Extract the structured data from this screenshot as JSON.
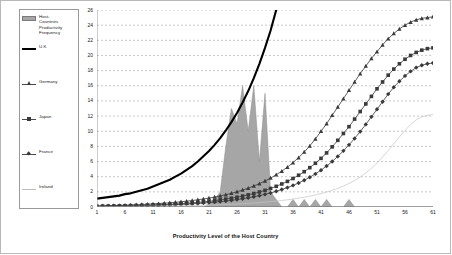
{
  "chart_data": {
    "type": "area",
    "title": "",
    "xlabel": "Productivity Level of the Host Country",
    "ylabel": "",
    "xlim": [
      1,
      61
    ],
    "ylim": [
      0,
      26
    ],
    "grid": true,
    "legend_position": "left-outside",
    "xticks": [
      1,
      6,
      11,
      16,
      21,
      26,
      31,
      36,
      41,
      46,
      51,
      56,
      61
    ],
    "yticks": [
      0,
      2,
      4,
      6,
      8,
      10,
      12,
      14,
      16,
      18,
      20,
      22,
      24,
      26
    ],
    "x": [
      1,
      2,
      3,
      4,
      5,
      6,
      7,
      8,
      9,
      10,
      11,
      12,
      13,
      14,
      15,
      16,
      17,
      18,
      19,
      20,
      21,
      22,
      23,
      24,
      25,
      26,
      27,
      28,
      29,
      30,
      31,
      32,
      33,
      34,
      35,
      36,
      37,
      38,
      39,
      40,
      41,
      42,
      43,
      44,
      45,
      46,
      47,
      48,
      49,
      50,
      51,
      52,
      53,
      54,
      55,
      56,
      57,
      58,
      59,
      60,
      61
    ],
    "series": [
      {
        "name": "Host-Countries Productivity Frequency",
        "label": "Host-\nCountries\nProductivity\nFrequency",
        "type": "area",
        "color": "#a6a6a6",
        "values": [
          0,
          0,
          0,
          0,
          0,
          0,
          0,
          0,
          0,
          0,
          0,
          0,
          0,
          0,
          0,
          0,
          0,
          0,
          0,
          0,
          0.4,
          1,
          2,
          8,
          13,
          11,
          16,
          10,
          16,
          6,
          15,
          2,
          1,
          0,
          0,
          1,
          0,
          1,
          0,
          1,
          0,
          1,
          0,
          0,
          0,
          1,
          0,
          0,
          0,
          0,
          0,
          0,
          0,
          0,
          0,
          0,
          0,
          0,
          0,
          0,
          0
        ]
      },
      {
        "name": "U.K",
        "label": "U.K",
        "type": "line",
        "color": "#000000",
        "marker": "none",
        "values": [
          1.1,
          1.2,
          1.3,
          1.4,
          1.5,
          1.7,
          1.8,
          2.0,
          2.2,
          2.4,
          2.7,
          3.0,
          3.3,
          3.6,
          4.0,
          4.4,
          4.9,
          5.4,
          6.0,
          6.7,
          7.4,
          8.2,
          9.1,
          10.1,
          11.2,
          12.4,
          13.8,
          15.3,
          17.0,
          18.9,
          21.0,
          23.3,
          26.0,
          null,
          null,
          null,
          null,
          null,
          null,
          null,
          null,
          null,
          null,
          null,
          null,
          null,
          null,
          null,
          null,
          null,
          null,
          null,
          null,
          null,
          null,
          null,
          null,
          null,
          null,
          null,
          null
        ]
      },
      {
        "name": "Germany",
        "label": "Germany",
        "type": "line",
        "color": "#3a3a3a",
        "marker": "triangle",
        "values": [
          0.15,
          0.16,
          0.18,
          0.2,
          0.22,
          0.24,
          0.27,
          0.3,
          0.33,
          0.37,
          0.41,
          0.45,
          0.5,
          0.56,
          0.62,
          0.69,
          0.77,
          0.85,
          0.95,
          1.06,
          1.18,
          1.31,
          1.46,
          1.62,
          1.81,
          2.01,
          2.24,
          2.49,
          2.77,
          3.08,
          3.43,
          3.82,
          4.25,
          4.73,
          5.26,
          5.86,
          6.52,
          7.25,
          8.07,
          8.98,
          9.99,
          11.0,
          12.1,
          13.2,
          14.3,
          15.4,
          16.5,
          17.6,
          18.6,
          19.6,
          20.5,
          21.4,
          22.2,
          22.9,
          23.5,
          24.0,
          24.4,
          24.7,
          24.9,
          25.0,
          25.1
        ]
      },
      {
        "name": "Japan",
        "label": "Japan",
        "type": "line",
        "color": "#3a3a3a",
        "marker": "square",
        "values": [
          0.1,
          0.11,
          0.12,
          0.13,
          0.15,
          0.16,
          0.18,
          0.2,
          0.22,
          0.24,
          0.27,
          0.3,
          0.33,
          0.36,
          0.4,
          0.45,
          0.5,
          0.55,
          0.61,
          0.68,
          0.76,
          0.84,
          0.94,
          1.04,
          1.16,
          1.29,
          1.44,
          1.6,
          1.78,
          1.98,
          2.2,
          2.45,
          2.73,
          3.04,
          3.38,
          3.76,
          4.19,
          4.66,
          5.19,
          5.77,
          6.42,
          7.14,
          7.94,
          8.8,
          9.7,
          10.6,
          11.6,
          12.6,
          13.6,
          14.6,
          15.6,
          16.5,
          17.4,
          18.2,
          18.9,
          19.5,
          20.0,
          20.4,
          20.7,
          20.9,
          21.0
        ]
      },
      {
        "name": "France",
        "label": "France",
        "type": "line",
        "color": "#3a3a3a",
        "marker": "diamond",
        "values": [
          0.08,
          0.09,
          0.1,
          0.11,
          0.12,
          0.13,
          0.14,
          0.16,
          0.17,
          0.19,
          0.21,
          0.23,
          0.26,
          0.28,
          0.31,
          0.35,
          0.38,
          0.43,
          0.47,
          0.52,
          0.58,
          0.64,
          0.71,
          0.79,
          0.88,
          0.98,
          1.09,
          1.21,
          1.35,
          1.5,
          1.67,
          1.86,
          2.07,
          2.3,
          2.56,
          2.85,
          3.17,
          3.53,
          3.93,
          4.37,
          4.86,
          5.41,
          6.01,
          6.68,
          7.41,
          8.2,
          9.05,
          9.95,
          10.9,
          11.9,
          12.9,
          13.9,
          14.9,
          15.8,
          16.6,
          17.3,
          17.9,
          18.4,
          18.7,
          18.9,
          19.0
        ]
      },
      {
        "name": "Ireland",
        "label": "Ireland",
        "type": "line",
        "color": "#c4c4c4",
        "marker": "none",
        "values": [
          0.05,
          0.05,
          0.06,
          0.06,
          0.07,
          0.07,
          0.08,
          0.08,
          0.09,
          0.1,
          0.11,
          0.12,
          0.13,
          0.14,
          0.15,
          0.16,
          0.18,
          0.19,
          0.21,
          0.23,
          0.25,
          0.28,
          0.3,
          0.33,
          0.36,
          0.4,
          0.44,
          0.48,
          0.53,
          0.58,
          0.64,
          0.71,
          0.78,
          0.86,
          0.95,
          1.05,
          1.16,
          1.29,
          1.43,
          1.59,
          1.77,
          1.97,
          2.2,
          2.46,
          2.76,
          3.1,
          3.5,
          3.96,
          4.5,
          5.12,
          5.82,
          6.6,
          7.45,
          8.35,
          9.25,
          10.1,
          10.9,
          11.5,
          11.9,
          12.1,
          12.2
        ]
      }
    ]
  },
  "legend": {
    "entries": [
      {
        "label": "Host-\nCountries\nProductivity\nFrequency",
        "key": "area-swatch"
      },
      {
        "label": "U.K",
        "key": "thick-line"
      },
      {
        "label": "Germany",
        "key": "triangle-line"
      },
      {
        "label": "Japan",
        "key": "square-line"
      },
      {
        "label": "France",
        "key": "diamond-line"
      },
      {
        "label": "Ireland",
        "key": "thin-line"
      }
    ]
  },
  "axes": {
    "x_title": "Productivity Level of the Host Country",
    "x_labels": [
      "1",
      "6",
      "11",
      "16",
      "21",
      "26",
      "31",
      "36",
      "41",
      "46",
      "51",
      "56",
      "61"
    ],
    "y_labels": [
      "0",
      "2",
      "4",
      "6",
      "8",
      "10",
      "12",
      "14",
      "16",
      "18",
      "20",
      "22",
      "24",
      "26"
    ]
  }
}
